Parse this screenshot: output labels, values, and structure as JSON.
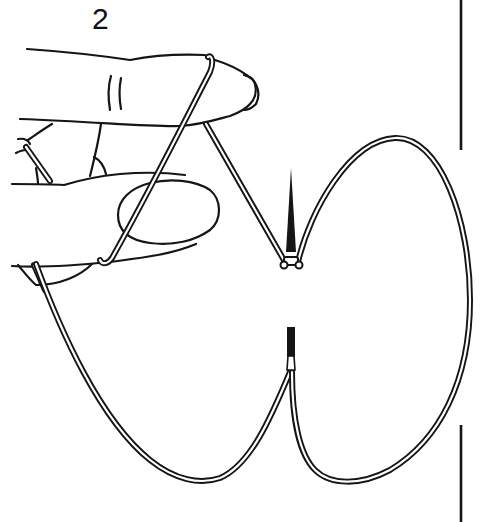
{
  "figure": {
    "step_label": "2",
    "colors": {
      "ink": "#151515",
      "background": "#ffffff"
    },
    "elements": [
      "step-number",
      "index-finger",
      "middle-finger",
      "thumb",
      "thread-loop-left",
      "thread-loop-right",
      "needle-upper",
      "needle-lower",
      "margin-rule"
    ]
  }
}
